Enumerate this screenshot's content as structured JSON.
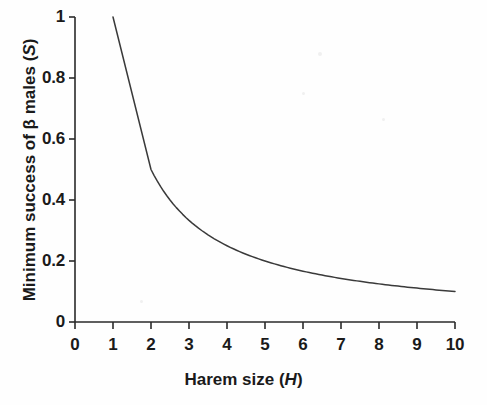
{
  "figure": {
    "background_color": "#fefefe",
    "line_color": "#3a3a3a",
    "axis_color": "#2a2a2a",
    "text_color": "#1a1a1a"
  },
  "axis_titles": {
    "x_prefix": "Harem size (",
    "x_italic": "H",
    "x_suffix": ")",
    "y_prefix": "Minimum success of β males (",
    "y_italic": "S",
    "y_suffix": ")"
  },
  "ticks": {
    "x": [
      "0",
      "1",
      "2",
      "3",
      "4",
      "5",
      "6",
      "7",
      "8",
      "9",
      "10"
    ],
    "y": [
      "0",
      "0.2",
      "0.4",
      "0.6",
      "0.8",
      "1"
    ]
  },
  "chart_data": {
    "type": "line",
    "title": "",
    "subtitle": "",
    "xlabel": "Harem size (H)",
    "ylabel": "Minimum success of β males (S)",
    "xlim": [
      0,
      10
    ],
    "ylim": [
      0,
      1
    ],
    "xticks": [
      0,
      1,
      2,
      3,
      4,
      5,
      6,
      7,
      8,
      9,
      10
    ],
    "yticks": [
      0,
      0.2,
      0.4,
      0.6,
      0.8,
      1
    ],
    "grid": false,
    "legend": null,
    "relationship": "S = 1 / H",
    "series": [
      {
        "name": "Minimum success of beta males",
        "x": [
          1,
          2,
          3,
          4,
          5,
          6,
          7,
          8,
          9,
          10
        ],
        "values": [
          1.0,
          0.5,
          0.333,
          0.25,
          0.2,
          0.167,
          0.143,
          0.125,
          0.111,
          0.1
        ]
      }
    ],
    "annotations": []
  }
}
